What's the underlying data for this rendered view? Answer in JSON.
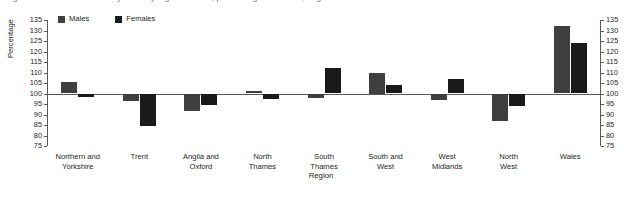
{
  "caption_sliver": "Figure 3  Standardised mortality ratios by region and sex, persons aged under 75, England and Wales",
  "axes": {
    "ylabel": "Percentage",
    "xlabel": "Region",
    "ytick_labels": [
      "135",
      "130",
      "125",
      "120",
      "115",
      "110",
      "105",
      "100",
      "95",
      "90",
      "85",
      "80",
      "75"
    ]
  },
  "legend": {
    "position": "top-left",
    "items": [
      {
        "label": "Males",
        "color": "#3f3f3f",
        "icon": "square-swatch-icon"
      },
      {
        "label": "Females",
        "color": "#1a1a1a",
        "icon": "square-swatch-icon"
      }
    ]
  },
  "chart_data": {
    "type": "bar",
    "title": "",
    "subtitle": "",
    "xlabel": "Region",
    "ylabel": "Percentage",
    "ylim": [
      75,
      135
    ],
    "ytick_step": 5,
    "baseline": 100,
    "grid": false,
    "legend_position": "top-left",
    "dual_axis": true,
    "categories": [
      "Northern and\nYorkshire",
      "Trent",
      "Anglia and\nOxford",
      "North\nThames",
      "South\nThames",
      "South and\nWest",
      "West\nMidlands",
      "North\nWest",
      "Wales"
    ],
    "series": [
      {
        "name": "Males",
        "color": "#3f3f3f",
        "values": [
          105.5,
          96.5,
          91.5,
          101.0,
          98.0,
          110.0,
          97.0,
          87.0,
          132.0
        ]
      },
      {
        "name": "Females",
        "color": "#1a1a1a",
        "values": [
          98.5,
          84.5,
          94.5,
          97.5,
          112.0,
          104.0,
          107.0,
          94.0,
          124.0
        ]
      }
    ]
  }
}
